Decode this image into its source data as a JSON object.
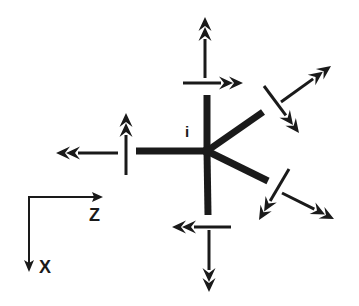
{
  "diagram": {
    "node_label": "i",
    "axes": {
      "horizontal_label": "Z",
      "vertical_label": "X"
    },
    "stroke_color": "#1a1a1a",
    "background_color": "#ffffff",
    "members": [
      {
        "name": "member-up",
        "from": [
          207,
          151
        ],
        "to": [
          207,
          95
        ]
      },
      {
        "name": "member-down",
        "from": [
          207,
          151
        ],
        "to": [
          208,
          215
        ]
      },
      {
        "name": "member-left",
        "from": [
          207,
          151
        ],
        "to": [
          136,
          151
        ]
      },
      {
        "name": "member-upper-right",
        "from": [
          207,
          151
        ],
        "to": [
          263,
          112
        ]
      },
      {
        "name": "member-lower-right",
        "from": [
          207,
          151
        ],
        "to": [
          268,
          181
        ]
      }
    ],
    "arrows": [
      {
        "name": "top-axial-arrow",
        "from": [
          205,
          78
        ],
        "to": [
          205,
          17
        ],
        "heads": 2
      },
      {
        "name": "top-shear-arrow",
        "from": [
          183,
          83
        ],
        "to": [
          243,
          83
        ],
        "heads": 2
      },
      {
        "name": "left-axial-arrow",
        "from": [
          118,
          153
        ],
        "to": [
          56,
          153
        ],
        "heads": 2
      },
      {
        "name": "left-shear-arrow",
        "from": [
          126,
          175
        ],
        "to": [
          126,
          113
        ],
        "heads": 2
      },
      {
        "name": "bottom-shear-arrow",
        "from": [
          231,
          227
        ],
        "to": [
          172,
          227
        ],
        "heads": 2
      },
      {
        "name": "bottom-axial-arrow",
        "from": [
          209,
          230
        ],
        "to": [
          209,
          292
        ],
        "heads": 2
      },
      {
        "name": "upper-right-shear-arrow",
        "from": [
          264,
          86
        ],
        "to": [
          299,
          133
        ],
        "heads": 2
      },
      {
        "name": "upper-right-axial-arrow",
        "from": [
          281,
          102
        ],
        "to": [
          331,
          66
        ],
        "heads": 2
      },
      {
        "name": "lower-right-shear-arrow",
        "from": [
          289,
          169
        ],
        "to": [
          259,
          220
        ],
        "heads": 2
      },
      {
        "name": "lower-right-axial-arrow",
        "from": [
          282,
          193
        ],
        "to": [
          334,
          219
        ],
        "heads": 2
      }
    ]
  }
}
